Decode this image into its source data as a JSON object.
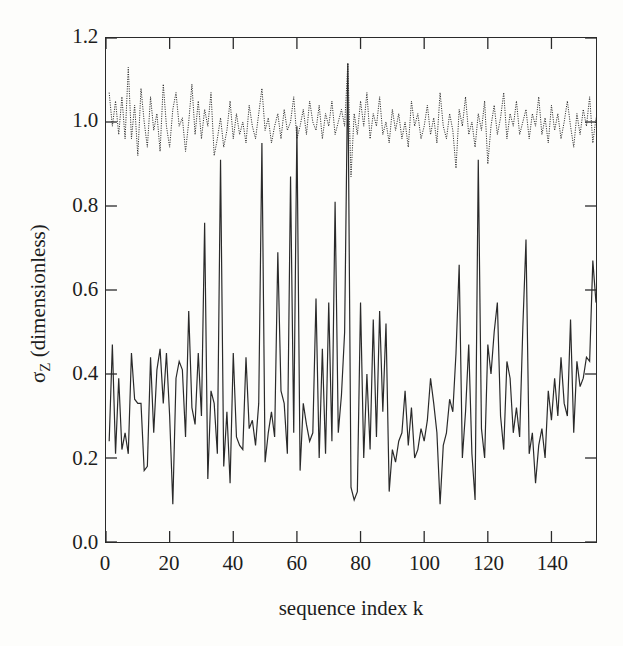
{
  "figure": {
    "background_color": "#fdfdfb",
    "ink_color": "#1d1d1d",
    "frame_color": "#2a2a2a"
  },
  "chart_data": {
    "type": "line",
    "title": "",
    "subtitle": "",
    "xlabel": "sequence index k",
    "ylabel": "σZ (dimensionless)",
    "ylabel_base": "σ",
    "ylabel_subscript": "Z",
    "ylabel_suffix": " (dimensionless)",
    "xlim": [
      0,
      154
    ],
    "ylim": [
      0.0,
      1.2
    ],
    "xticks": [
      0,
      20,
      40,
      60,
      80,
      100,
      120,
      140
    ],
    "xtick_labels": [
      "0",
      "20",
      "40",
      "60",
      "80",
      "100",
      "120",
      "140"
    ],
    "yticks": [
      0.0,
      0.2,
      0.4,
      0.6,
      0.8,
      1.0,
      1.2
    ],
    "ytick_labels": [
      "0.0",
      "0.2",
      "0.4",
      "0.6",
      "0.8",
      "1.0",
      "1.2"
    ],
    "tick_direction": "in",
    "grid": false,
    "legend": null,
    "legend_position": "none",
    "frame": "box",
    "series": [
      {
        "name": "upper-dotted-series",
        "style": "dotted",
        "color": "#2a2a2a",
        "linewidth": 1.0,
        "x": [
          1,
          2,
          3,
          4,
          5,
          6,
          7,
          8,
          9,
          10,
          11,
          12,
          13,
          14,
          15,
          16,
          17,
          18,
          19,
          20,
          21,
          22,
          23,
          24,
          25,
          26,
          27,
          28,
          29,
          30,
          31,
          32,
          33,
          34,
          35,
          36,
          37,
          38,
          39,
          40,
          41,
          42,
          43,
          44,
          45,
          46,
          47,
          48,
          49,
          50,
          51,
          52,
          53,
          54,
          55,
          56,
          57,
          58,
          59,
          60,
          61,
          62,
          63,
          64,
          65,
          66,
          67,
          68,
          69,
          70,
          71,
          72,
          73,
          74,
          75,
          76,
          77,
          78,
          79,
          80,
          81,
          82,
          83,
          84,
          85,
          86,
          87,
          88,
          89,
          90,
          91,
          92,
          93,
          94,
          95,
          96,
          97,
          98,
          99,
          100,
          101,
          102,
          103,
          104,
          105,
          106,
          107,
          108,
          109,
          110,
          111,
          112,
          113,
          114,
          115,
          116,
          117,
          118,
          119,
          120,
          121,
          122,
          123,
          124,
          125,
          126,
          127,
          128,
          129,
          130,
          131,
          132,
          133,
          134,
          135,
          136,
          137,
          138,
          139,
          140,
          141,
          142,
          143,
          144,
          145,
          146,
          147,
          148,
          149,
          150,
          151,
          152,
          153,
          154
        ],
        "values": [
          1.07,
          0.99,
          1.05,
          0.97,
          1.06,
          0.96,
          1.13,
          0.96,
          1.04,
          0.92,
          1.08,
          1.0,
          0.94,
          1.06,
          0.98,
          1.02,
          0.93,
          1.09,
          0.99,
          0.94,
          1.03,
          1.07,
          0.99,
          1.01,
          0.93,
          1.0,
          1.09,
          0.97,
          1.05,
          0.96,
          1.03,
          0.99,
          1.07,
          0.92,
          0.96,
          1.01,
          0.94,
          0.98,
          1.05,
          0.96,
          1.02,
          0.97,
          1.0,
          0.95,
          1.04,
          0.99,
          0.96,
          1.02,
          1.08,
          0.98,
          1.01,
          0.95,
          0.99,
          1.02,
          0.96,
          1.03,
          0.98,
          1.0,
          1.06,
          0.96,
          0.99,
          1.03,
          0.97,
          1.05,
          1.0,
          0.98,
          1.04,
          0.96,
          1.02,
          0.99,
          1.05,
          0.97,
          1.0,
          1.03,
          0.99,
          1.14,
          0.87,
          1.02,
          0.97,
          1.05,
          0.99,
          1.07,
          0.96,
          1.02,
          0.99,
          1.06,
          0.97,
          1.0,
          0.95,
          1.03,
          0.98,
          1.02,
          0.96,
          1.0,
          0.94,
          1.05,
          0.99,
          1.02,
          0.96,
          0.99,
          1.04,
          0.97,
          1.01,
          0.95,
          1.07,
          0.99,
          0.96,
          1.02,
          0.98,
          0.89,
          1.03,
          0.99,
          1.06,
          0.97,
          1.0,
          0.94,
          1.02,
          0.98,
          1.05,
          0.9,
          0.99,
          1.04,
          0.97,
          1.01,
          1.07,
          0.96,
          1.02,
          0.99,
          1.05,
          0.97,
          1.0,
          1.03,
          0.96,
          1.02,
          0.99,
          1.06,
          0.97,
          1.01,
          0.95,
          1.04,
          0.98,
          1.02,
          0.96,
          1.0,
          1.05,
          0.99,
          0.94,
          1.02,
          0.97,
          1.03,
          0.99,
          1.06,
          0.95,
          1.01
        ]
      },
      {
        "name": "lower-solid-series",
        "style": "solid",
        "color": "#2a2a2a",
        "linewidth": 1.2,
        "x": [
          1,
          2,
          3,
          4,
          5,
          6,
          7,
          8,
          9,
          10,
          11,
          12,
          13,
          14,
          15,
          16,
          17,
          18,
          19,
          20,
          21,
          22,
          23,
          24,
          25,
          26,
          27,
          28,
          29,
          30,
          31,
          32,
          33,
          34,
          35,
          36,
          37,
          38,
          39,
          40,
          41,
          42,
          43,
          44,
          45,
          46,
          47,
          48,
          49,
          50,
          51,
          52,
          53,
          54,
          55,
          56,
          57,
          58,
          59,
          60,
          61,
          62,
          63,
          64,
          65,
          66,
          67,
          68,
          69,
          70,
          71,
          72,
          73,
          74,
          75,
          76,
          77,
          78,
          79,
          80,
          81,
          82,
          83,
          84,
          85,
          86,
          87,
          88,
          89,
          90,
          91,
          92,
          93,
          94,
          95,
          96,
          97,
          98,
          99,
          100,
          101,
          102,
          103,
          104,
          105,
          106,
          107,
          108,
          109,
          110,
          111,
          112,
          113,
          114,
          115,
          116,
          117,
          118,
          119,
          120,
          121,
          122,
          123,
          124,
          125,
          126,
          127,
          128,
          129,
          130,
          131,
          132,
          133,
          134,
          135,
          136,
          137,
          138,
          139,
          140,
          141,
          142,
          143,
          144,
          145,
          146,
          147,
          148,
          149,
          150,
          151,
          152,
          153,
          154
        ],
        "values": [
          0.24,
          0.47,
          0.21,
          0.39,
          0.22,
          0.26,
          0.21,
          0.45,
          0.34,
          0.33,
          0.33,
          0.17,
          0.18,
          0.44,
          0.26,
          0.41,
          0.46,
          0.33,
          0.45,
          0.3,
          0.09,
          0.39,
          0.43,
          0.41,
          0.25,
          0.55,
          0.32,
          0.28,
          0.45,
          0.3,
          0.76,
          0.15,
          0.36,
          0.33,
          0.21,
          0.91,
          0.18,
          0.31,
          0.14,
          0.45,
          0.25,
          0.23,
          0.22,
          0.44,
          0.27,
          0.29,
          0.23,
          0.33,
          0.95,
          0.19,
          0.26,
          0.31,
          0.25,
          0.69,
          0.36,
          0.33,
          0.21,
          0.87,
          0.26,
          0.99,
          0.17,
          0.33,
          0.28,
          0.24,
          0.26,
          0.58,
          0.2,
          0.46,
          0.21,
          0.57,
          0.24,
          0.81,
          0.26,
          0.35,
          0.5,
          1.14,
          0.13,
          0.1,
          0.12,
          0.57,
          0.2,
          0.4,
          0.22,
          0.53,
          0.25,
          0.55,
          0.31,
          0.52,
          0.12,
          0.22,
          0.19,
          0.24,
          0.26,
          0.36,
          0.23,
          0.32,
          0.2,
          0.22,
          0.27,
          0.24,
          0.29,
          0.39,
          0.33,
          0.26,
          0.09,
          0.23,
          0.26,
          0.34,
          0.31,
          0.45,
          0.66,
          0.2,
          0.31,
          0.47,
          0.21,
          0.1,
          0.91,
          0.27,
          0.2,
          0.47,
          0.4,
          0.5,
          0.57,
          0.3,
          0.22,
          0.43,
          0.39,
          0.26,
          0.32,
          0.25,
          0.51,
          0.72,
          0.21,
          0.26,
          0.14,
          0.23,
          0.27,
          0.2,
          0.36,
          0.29,
          0.39,
          0.3,
          0.44,
          0.33,
          0.3,
          0.53,
          0.26,
          0.43,
          0.37,
          0.39,
          0.44,
          0.43,
          0.67,
          0.57
        ]
      }
    ]
  }
}
